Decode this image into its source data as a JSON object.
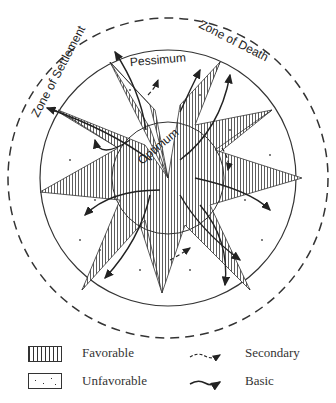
{
  "diagram": {
    "zones": {
      "outer_label_left": "Zone of Settlement",
      "outer_label_right": "Zone of Death",
      "middle_label": "Pessimum",
      "inner_label": "Optimum"
    }
  },
  "legend": {
    "favorable": "Favorable",
    "unfavorable": "Unfavorable",
    "secondary": "Secondary",
    "basic": "Basic"
  }
}
